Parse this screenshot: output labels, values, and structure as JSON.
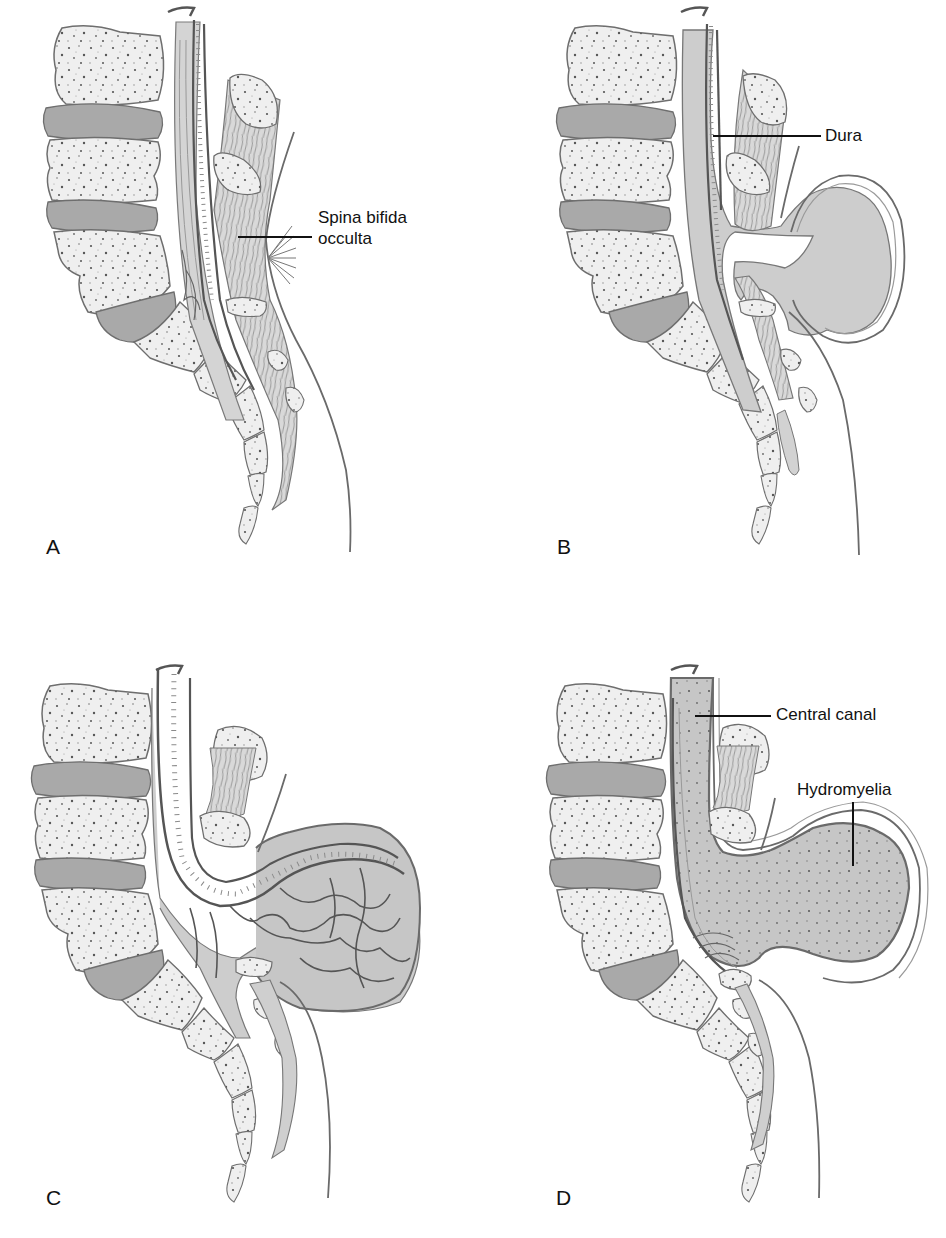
{
  "figure": {
    "panels": [
      {
        "id": "A",
        "letter": "A",
        "labels": [
          {
            "text_line1": "Spina bifida",
            "text_line2": "occulta"
          }
        ]
      },
      {
        "id": "B",
        "letter": "B",
        "labels": [
          {
            "text": "Dura"
          }
        ]
      },
      {
        "id": "C",
        "letter": "C",
        "labels": []
      },
      {
        "id": "D",
        "letter": "D",
        "labels": [
          {
            "text": "Central canal"
          },
          {
            "text": "Hydromyelia"
          }
        ]
      }
    ]
  },
  "colors": {
    "bone_fill": "#efefef",
    "disc_fill": "#a9a9a9",
    "outline": "#6e6e6e",
    "tissue_fill": "#cfcfcf",
    "sac_fill": "#c8c8c8",
    "ink": "#111111"
  }
}
